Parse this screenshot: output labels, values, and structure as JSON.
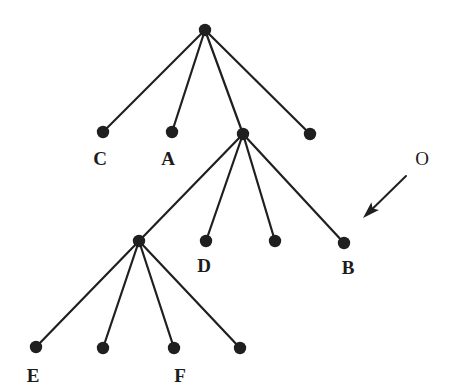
{
  "figure": {
    "type": "node-link-tree-diagram",
    "width": 450,
    "height": 392,
    "background_color": "#ffffff",
    "ink_color": "#1f1f1f",
    "node_radius": 6.2,
    "edge_width": 2.2
  },
  "chart_data": {
    "type": "diagram",
    "title": "",
    "nodes": [
      {
        "id": "root",
        "label": "",
        "x": 205,
        "y": 30,
        "level": 0
      },
      {
        "id": "n_C",
        "label": "C",
        "x": 103,
        "y": 132,
        "level": 1
      },
      {
        "id": "n_A",
        "label": "A",
        "x": 172,
        "y": 132,
        "level": 1
      },
      {
        "id": "n_M1",
        "label": "",
        "x": 243,
        "y": 134,
        "level": 1
      },
      {
        "id": "n_R1",
        "label": "",
        "x": 310,
        "y": 134,
        "level": 1
      },
      {
        "id": "n_M2",
        "label": "",
        "x": 139,
        "y": 241,
        "level": 2
      },
      {
        "id": "n_D",
        "label": "D",
        "x": 206,
        "y": 241,
        "level": 2
      },
      {
        "id": "n_U1",
        "label": "",
        "x": 275,
        "y": 241,
        "level": 2
      },
      {
        "id": "n_B",
        "label": "B",
        "x": 344,
        "y": 243,
        "level": 2
      },
      {
        "id": "n_E",
        "label": "E",
        "x": 36,
        "y": 347,
        "level": 3
      },
      {
        "id": "n_U2",
        "label": "",
        "x": 103,
        "y": 348,
        "level": 3
      },
      {
        "id": "n_F",
        "label": "F",
        "x": 174,
        "y": 348,
        "level": 3
      },
      {
        "id": "n_U3",
        "label": "",
        "x": 240,
        "y": 348,
        "level": 3
      }
    ],
    "edges": [
      {
        "from": "root",
        "to": "n_C"
      },
      {
        "from": "root",
        "to": "n_A"
      },
      {
        "from": "root",
        "to": "n_M1"
      },
      {
        "from": "root",
        "to": "n_R1"
      },
      {
        "from": "n_M1",
        "to": "n_M2"
      },
      {
        "from": "n_M1",
        "to": "n_D"
      },
      {
        "from": "n_M1",
        "to": "n_U1"
      },
      {
        "from": "n_M1",
        "to": "n_B"
      },
      {
        "from": "n_M2",
        "to": "n_E"
      },
      {
        "from": "n_M2",
        "to": "n_U2"
      },
      {
        "from": "n_M2",
        "to": "n_F"
      },
      {
        "from": "n_M2",
        "to": "n_U3"
      }
    ],
    "node_labels": [
      {
        "text": "C",
        "x": 100,
        "y": 158
      },
      {
        "text": "A",
        "x": 168,
        "y": 158
      },
      {
        "text": "D",
        "x": 204,
        "y": 265
      },
      {
        "text": "B",
        "x": 348,
        "y": 267
      },
      {
        "text": "E",
        "x": 33,
        "y": 375
      },
      {
        "text": "F",
        "x": 180,
        "y": 375
      }
    ],
    "annotations": [
      {
        "id": "pointer-O",
        "label": "O",
        "label_x": 422,
        "label_y": 158,
        "arrow_tail_x": 406,
        "arrow_tail_y": 176,
        "arrow_head_x": 363,
        "arrow_head_y": 218
      }
    ]
  }
}
